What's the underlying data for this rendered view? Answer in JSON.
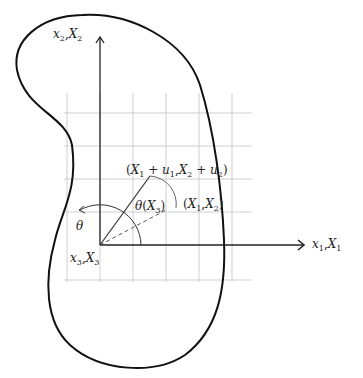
{
  "diagram": {
    "type": "continuum-body-torsion-sketch",
    "colors": {
      "outline": "#111111",
      "axes": "#222222",
      "grid": "#cccccc",
      "vector": "#333333",
      "dashed": "#555555",
      "arc": "#555555"
    },
    "labels": {
      "vertical_axis": {
        "var1": "x",
        "sub1": "2",
        "var2": "X",
        "sub2": "2"
      },
      "horizontal_axis": {
        "var1": "x",
        "sub1": "1",
        "var2": "X",
        "sub2": "1"
      },
      "origin_axis": {
        "var1": "x",
        "sub1": "3",
        "var2": "X",
        "sub2": "3"
      },
      "rotation_angle": "θ",
      "twist_angle": {
        "symbol": "θ",
        "arg": "X",
        "sub": "3"
      },
      "deformed_point": {
        "a": "X",
        "a_sub": "1",
        "plus1": "+",
        "u1": "u",
        "u1_sub": "1",
        "b": "X",
        "b_sub": "2",
        "plus2": "+",
        "u2": "u",
        "u2_sub": "2"
      },
      "original_point": {
        "a": "X",
        "a_sub": "1",
        "b": "X",
        "b_sub": "2"
      }
    },
    "geometry": {
      "origin": [
        100,
        245
      ],
      "vertical_axis_top": [
        100,
        38
      ],
      "horizontal_axis_end": [
        305,
        245
      ],
      "original_point": [
        166,
        210
      ],
      "deformed_point": [
        150,
        176
      ],
      "grid_x": [
        67,
        100,
        133,
        166,
        199,
        232
      ],
      "grid_y": [
        113,
        146,
        179,
        212,
        245,
        280
      ],
      "grid_extent": {
        "x_min": 65,
        "x_max": 252,
        "y_min": 93,
        "y_max": 282
      }
    }
  }
}
